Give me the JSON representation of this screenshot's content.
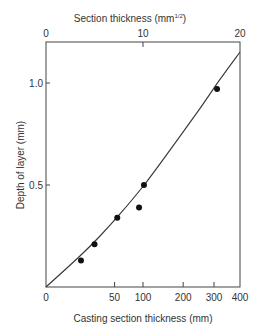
{
  "chart_data": {
    "type": "scatter",
    "title": "",
    "xlabel": "Casting section thickness (mm)",
    "x2label": "Section thickness (mm",
    "x2label_sup": "1/2",
    "x2label_close": ")",
    "ylabel": "Depth of layer (mm)",
    "x_scale": "sqrt",
    "xlim_sqrt": [
      0,
      20
    ],
    "ylim": [
      0,
      1.2
    ],
    "x_ticks": [
      {
        "label": "0",
        "value": 0
      },
      {
        "label": "50",
        "value": 50
      },
      {
        "label": "100",
        "value": 100
      },
      {
        "label": "200",
        "value": 200
      },
      {
        "label": "300",
        "value": 300
      },
      {
        "label": "400",
        "value": 400
      }
    ],
    "x2_ticks": [
      {
        "label": "0",
        "value": 0
      },
      {
        "label": "10",
        "value": 10
      },
      {
        "label": "20",
        "value": 20
      }
    ],
    "y_ticks": [
      {
        "label": "0.5",
        "value": 0.5
      },
      {
        "label": "1.0",
        "value": 1.0
      }
    ],
    "grid": false,
    "legend": null,
    "series": [
      {
        "name": "Measured",
        "kind": "points",
        "x_mm": [
          13,
          25,
          54,
          92,
          102,
          311
        ],
        "y": [
          0.13,
          0.21,
          0.34,
          0.39,
          0.5,
          0.97
        ]
      },
      {
        "name": "Fitted curve",
        "kind": "line",
        "x_sqrt": [
          0,
          3.5,
          5.57,
          7.63,
          10.2,
          12.8,
          15.9,
          17.9,
          20.0
        ],
        "y": [
          0,
          0.152,
          0.25,
          0.358,
          0.505,
          0.672,
          0.877,
          1.015,
          1.152
        ]
      }
    ]
  }
}
